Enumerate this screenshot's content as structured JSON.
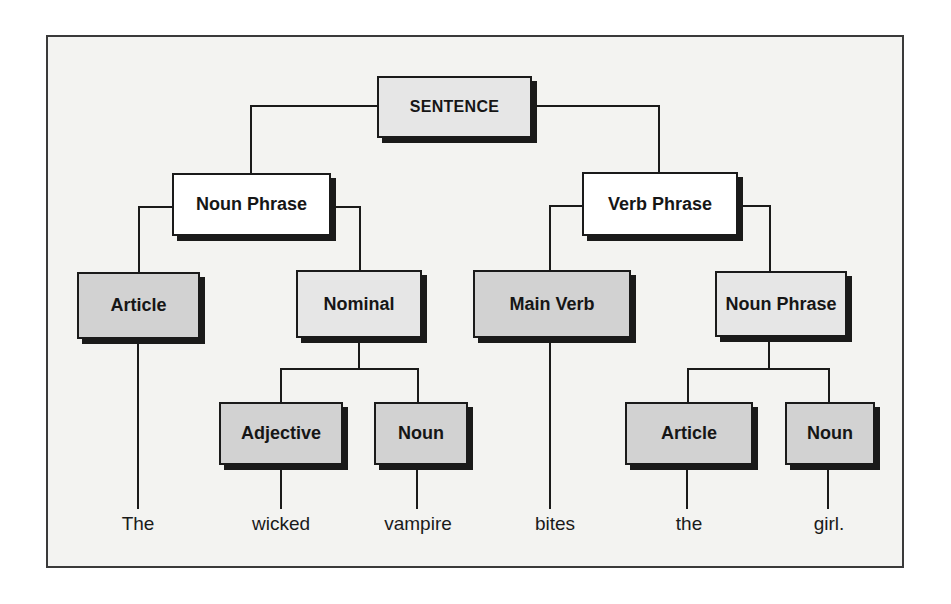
{
  "diagram": {
    "type": "parse-tree",
    "nodes": {
      "sentence": "SENTENCE",
      "noun_phrase_left": "Noun Phrase",
      "verb_phrase": "Verb Phrase",
      "article_left": "Article",
      "nominal": "Nominal",
      "main_verb": "Main Verb",
      "noun_phrase_right": "Noun Phrase",
      "adjective": "Adjective",
      "noun_left": "Noun",
      "article_right": "Article",
      "noun_right": "Noun"
    },
    "words": [
      "The",
      "wicked",
      "vampire",
      "bites",
      "the",
      "girl."
    ],
    "colors": {
      "phrase_box": "#ffffff",
      "nominal_box": "#e6e6e6",
      "category_box": "#d2d2d2",
      "line": "#1a1a1a",
      "frame_bg": "#f3f3f1"
    }
  }
}
